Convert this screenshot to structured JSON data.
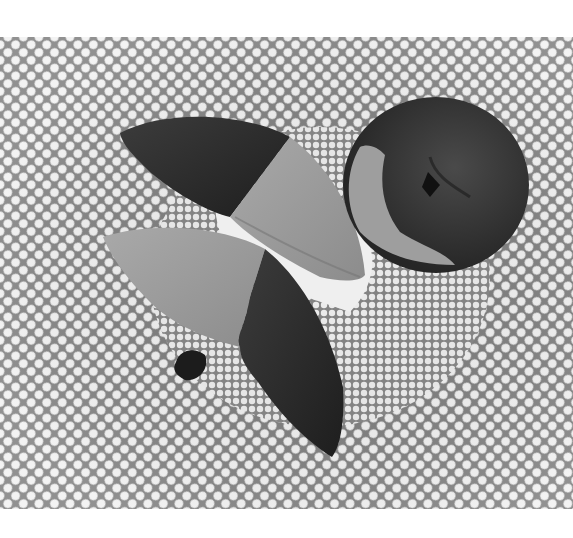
{
  "image": {
    "description": "Black-and-white photograph of chocolate-dipped candied fruit slices on a plate with a radial dotted mesh pattern",
    "alt": "Chocolate-dipped candied citrus and pear slices on a patterned plate",
    "subjects": [
      {
        "name": "half-dipped-pear-slice-top",
        "description": "Crescent slice, left half dark chocolate, right half pale candied fruit"
      },
      {
        "name": "dipped-round-fruit-right",
        "description": "Round candied fruit mostly coated in dark chocolate with lighter exposed edge"
      },
      {
        "name": "half-dipped-slice-bottom",
        "description": "Large crescent slice, upper-left pale candied fruit, right part dark chocolate, small chocolate chunk at base"
      }
    ],
    "background": "radial honeycomb/mesh plate pattern",
    "colors": {
      "paper": "#ffffff",
      "mesh_light": "#f2f2f2",
      "mesh_dark": "#7a7a7a",
      "chocolate": "#2e2e2e",
      "fruit": "#9a9a9a",
      "plate_white": "#ededed"
    }
  }
}
